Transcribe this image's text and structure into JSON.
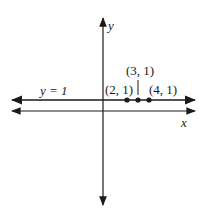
{
  "diagram": {
    "axes": {
      "x_label": "x",
      "y_label": "y"
    },
    "line": {
      "label": "y = 1",
      "equation": "y = 1"
    },
    "points": [
      {
        "label": "(2, 1)",
        "x": 2,
        "y": 1
      },
      {
        "label": "(3, 1)",
        "x": 3,
        "y": 1
      },
      {
        "label": "(4, 1)",
        "x": 4,
        "y": 1
      }
    ],
    "colors": {
      "stroke": "#1a1a1a",
      "background": "#ffffff"
    }
  }
}
